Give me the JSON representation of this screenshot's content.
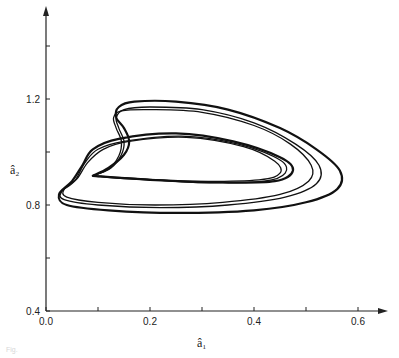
{
  "chart_data": {
    "type": "line",
    "title": "",
    "xlabel": "â₁",
    "ylabel": "â₂",
    "xlim": [
      0.0,
      0.65
    ],
    "ylim": [
      0.4,
      1.5
    ],
    "grid": false,
    "legend": null,
    "x_ticks": [
      0.0,
      0.1,
      0.2,
      0.3,
      0.4,
      0.5,
      0.6
    ],
    "x_tick_labels": [
      "0.0",
      "",
      "0.2",
      "",
      "0.4",
      "",
      "0.6"
    ],
    "y_ticks": [
      0.4,
      0.6,
      0.8,
      1.0,
      1.2,
      1.4
    ],
    "y_tick_labels": [
      "0.4",
      "",
      "0.8",
      "",
      "1.2",
      ""
    ],
    "series": [
      {
        "name": "trajectory-outer",
        "points": [
          [
            0.09,
            0.91
          ],
          [
            0.12,
            0.94
          ],
          [
            0.15,
            0.99
          ],
          [
            0.16,
            1.04
          ],
          [
            0.15,
            1.09
          ],
          [
            0.135,
            1.13
          ],
          [
            0.14,
            1.17
          ],
          [
            0.17,
            1.19
          ],
          [
            0.25,
            1.19
          ],
          [
            0.35,
            1.16
          ],
          [
            0.45,
            1.09
          ],
          [
            0.52,
            1.01
          ],
          [
            0.565,
            0.93
          ],
          [
            0.56,
            0.86
          ],
          [
            0.5,
            0.81
          ],
          [
            0.4,
            0.78
          ],
          [
            0.25,
            0.77
          ],
          [
            0.12,
            0.78
          ],
          [
            0.04,
            0.8
          ],
          [
            0.025,
            0.84
          ],
          [
            0.05,
            0.89
          ],
          [
            0.07,
            0.95
          ],
          [
            0.09,
            1.01
          ],
          [
            0.14,
            1.05
          ],
          [
            0.25,
            1.07
          ],
          [
            0.36,
            1.04
          ],
          [
            0.45,
            0.98
          ],
          [
            0.475,
            0.93
          ],
          [
            0.44,
            0.89
          ],
          [
            0.34,
            0.885
          ],
          [
            0.2,
            0.895
          ],
          [
            0.09,
            0.91
          ]
        ]
      },
      {
        "name": "trajectory-middle",
        "points": [
          [
            0.09,
            0.91
          ],
          [
            0.125,
            0.94
          ],
          [
            0.145,
            0.99
          ],
          [
            0.15,
            1.04
          ],
          [
            0.14,
            1.09
          ],
          [
            0.135,
            1.13
          ],
          [
            0.15,
            1.16
          ],
          [
            0.2,
            1.17
          ],
          [
            0.3,
            1.16
          ],
          [
            0.4,
            1.11
          ],
          [
            0.48,
            1.03
          ],
          [
            0.525,
            0.95
          ],
          [
            0.52,
            0.88
          ],
          [
            0.46,
            0.83
          ],
          [
            0.35,
            0.8
          ],
          [
            0.22,
            0.79
          ],
          [
            0.1,
            0.8
          ],
          [
            0.035,
            0.82
          ],
          [
            0.03,
            0.85
          ],
          [
            0.055,
            0.89
          ],
          [
            0.075,
            0.96
          ],
          [
            0.1,
            1.01
          ],
          [
            0.15,
            1.04
          ],
          [
            0.26,
            1.06
          ],
          [
            0.37,
            1.03
          ],
          [
            0.45,
            0.97
          ],
          [
            0.46,
            0.92
          ],
          [
            0.42,
            0.89
          ],
          [
            0.3,
            0.885
          ],
          [
            0.17,
            0.9
          ],
          [
            0.09,
            0.91
          ]
        ]
      },
      {
        "name": "trajectory-inner",
        "points": [
          [
            0.09,
            0.91
          ],
          [
            0.12,
            0.935
          ],
          [
            0.14,
            0.985
          ],
          [
            0.145,
            1.04
          ],
          [
            0.135,
            1.09
          ],
          [
            0.13,
            1.13
          ],
          [
            0.145,
            1.155
          ],
          [
            0.2,
            1.16
          ],
          [
            0.3,
            1.15
          ],
          [
            0.4,
            1.1
          ],
          [
            0.47,
            1.03
          ],
          [
            0.51,
            0.95
          ],
          [
            0.505,
            0.89
          ],
          [
            0.45,
            0.84
          ],
          [
            0.34,
            0.81
          ],
          [
            0.21,
            0.8
          ],
          [
            0.1,
            0.81
          ],
          [
            0.04,
            0.83
          ],
          [
            0.035,
            0.86
          ],
          [
            0.06,
            0.9
          ],
          [
            0.08,
            0.96
          ],
          [
            0.11,
            1.01
          ],
          [
            0.16,
            1.04
          ],
          [
            0.27,
            1.055
          ],
          [
            0.38,
            1.02
          ],
          [
            0.44,
            0.965
          ],
          [
            0.45,
            0.92
          ],
          [
            0.41,
            0.895
          ],
          [
            0.28,
            0.89
          ],
          [
            0.15,
            0.9
          ],
          [
            0.09,
            0.91
          ]
        ]
      }
    ]
  },
  "caption": "Fig."
}
